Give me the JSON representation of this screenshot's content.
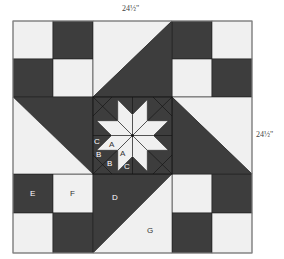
{
  "diagram": {
    "type": "quilt-block",
    "dimensions": {
      "width_label": "24½\"",
      "height_label": "24½\""
    },
    "colors": {
      "dark": "#3d3d3d",
      "light": "#f0f0f0",
      "line": "#222222",
      "border": "#8a8a8a"
    },
    "piece_labels": {
      "A1": "A",
      "A2": "A",
      "B1": "B",
      "B2": "B",
      "C1": "C",
      "C2": "C",
      "D": "D",
      "E": "E",
      "F": "F",
      "G": "G"
    }
  }
}
